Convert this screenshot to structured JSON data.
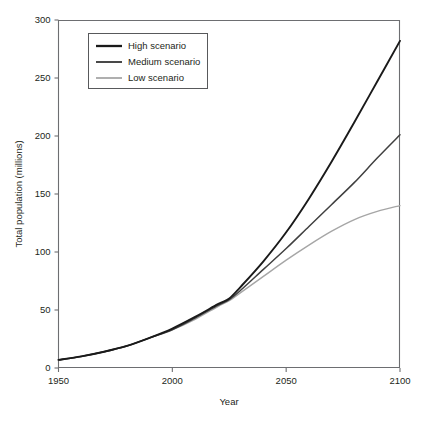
{
  "chart_data": {
    "type": "line",
    "title": "",
    "xlabel": "Year",
    "ylabel": "Total population (millions)",
    "xlim": [
      1950,
      2100
    ],
    "ylim": [
      0,
      300
    ],
    "xticks": [
      1950,
      2000,
      2050,
      2100
    ],
    "yticks": [
      0,
      50,
      100,
      150,
      200,
      250,
      300
    ],
    "xtick_labels": [
      "1950",
      "2000",
      "2050",
      "2100"
    ],
    "ytick_labels": [
      "0",
      "50",
      "100",
      "150",
      "200",
      "250",
      "300"
    ],
    "grid": false,
    "legend_position": "upper-left-inside",
    "x": [
      1950,
      1960,
      1970,
      1980,
      1990,
      2000,
      2010,
      2020,
      2025,
      2030,
      2040,
      2050,
      2060,
      2070,
      2080,
      2090,
      2100
    ],
    "series": [
      {
        "name": "High scenario",
        "color": "#1a1a1a",
        "width": 1.9,
        "values": [
          7,
          10,
          14,
          19,
          26,
          34,
          44,
          55,
          60,
          70,
          92,
          117,
          146,
          178,
          212,
          247,
          282
        ]
      },
      {
        "name": "Medium scenario",
        "color": "#404040",
        "width": 1.5,
        "values": [
          7,
          10,
          14,
          19,
          26,
          33,
          43,
          54,
          59,
          67,
          85,
          103,
          122,
          141,
          160,
          181,
          201
        ]
      },
      {
        "name": "Low scenario",
        "color": "#a6a6a6",
        "width": 1.4,
        "values": [
          7,
          10,
          14,
          19,
          26,
          33,
          42,
          53,
          58,
          65,
          79,
          93,
          106,
          118,
          128,
          135,
          140
        ]
      }
    ]
  },
  "legend": {
    "items": [
      {
        "label": "High scenario"
      },
      {
        "label": "Medium scenario"
      },
      {
        "label": "Low scenario"
      }
    ]
  },
  "colors": {
    "axis": "#6d6e71",
    "text": "#231f20",
    "background": "#ffffff",
    "high": "#1a1a1a",
    "medium": "#404040",
    "low": "#a6a6a6"
  }
}
